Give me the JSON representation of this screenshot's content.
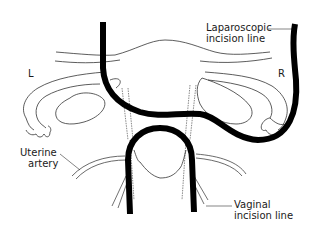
{
  "diagram": {
    "labels": {
      "left_side": "L",
      "right_side": "R",
      "laparoscopic_line1": "Laparoscopic",
      "laparoscopic_line2": "incision line",
      "uterine_artery_line1": "Uterine",
      "uterine_artery_line2": "artery",
      "vaginal_line1": "Vaginal",
      "vaginal_line2": "incision line"
    },
    "colors": {
      "background": "#ffffff",
      "ink": "#000000",
      "thin_line": "#333333"
    }
  }
}
